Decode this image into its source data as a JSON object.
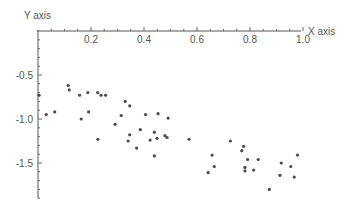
{
  "chart_data": {
    "type": "scatter",
    "title": "",
    "xlabel": "X axis",
    "ylabel": "Y axis",
    "xlim": [
      0,
      1.0
    ],
    "ylim": [
      -1.9,
      0
    ],
    "x_ticks": [
      0.2,
      0.4,
      0.6,
      0.8,
      1.0
    ],
    "x_tick_labels": [
      "0.2",
      "0.4",
      "0.6",
      "0.8",
      "1.0"
    ],
    "y_ticks": [
      -0.5,
      -1.0,
      -1.5
    ],
    "y_tick_labels": [
      "-0.5",
      "-1.0",
      "-1.5"
    ],
    "grid": false,
    "legend": null,
    "point_color": "#4a4a4a",
    "axis_color": "#555555",
    "series": [
      {
        "name": "data",
        "x": [
          0.004,
          0.031,
          0.063,
          0.114,
          0.118,
          0.157,
          0.163,
          0.188,
          0.191,
          0.225,
          0.226,
          0.238,
          0.255,
          0.291,
          0.314,
          0.329,
          0.346,
          0.34,
          0.346,
          0.372,
          0.386,
          0.406,
          0.423,
          0.439,
          0.439,
          0.449,
          0.453,
          0.479,
          0.487,
          0.491,
          0.57,
          0.642,
          0.657,
          0.665,
          0.726,
          0.769,
          0.776,
          0.781,
          0.781,
          0.791,
          0.814,
          0.831,
          0.873,
          0.913,
          0.918,
          0.954,
          0.967,
          0.979
        ],
        "y": [
          -0.73,
          -0.95,
          -0.92,
          -0.62,
          -0.67,
          -0.73,
          -1.0,
          -0.7,
          -0.92,
          -0.7,
          -1.23,
          -0.73,
          -0.73,
          -1.06,
          -0.96,
          -0.8,
          -0.85,
          -1.25,
          -1.18,
          -1.33,
          -1.12,
          -0.95,
          -1.24,
          -1.15,
          -1.42,
          -1.22,
          -0.94,
          -1.19,
          -1.21,
          -0.99,
          -1.23,
          -1.61,
          -1.41,
          -1.54,
          -1.25,
          -1.36,
          -1.31,
          -1.55,
          -1.59,
          -1.46,
          -1.58,
          -1.46,
          -1.8,
          -1.64,
          -1.5,
          -1.54,
          -1.66,
          -1.41
        ]
      }
    ]
  }
}
